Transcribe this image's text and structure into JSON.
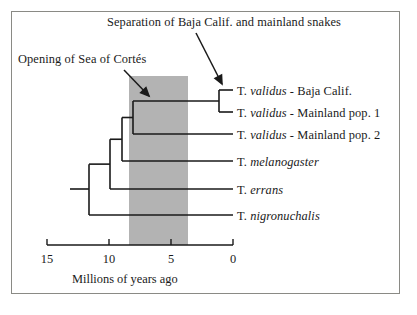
{
  "figure": {
    "width": 417,
    "height": 315,
    "background": "#ffffff",
    "frame_color": "#8a8a85",
    "line_color": "#1a1a1a",
    "band_color": "#b3b3b3"
  },
  "annotations": [
    {
      "id": "separation-event",
      "text": "Separation of Baja Calif. and mainland snakes",
      "x": 107,
      "y": 15,
      "arrow": {
        "x1": 196,
        "y1": 33,
        "x2": 222,
        "y2": 84
      }
    },
    {
      "id": "sea-of-cortes-event",
      "text": "Opening of Sea of Cortés",
      "x": 18,
      "y": 52,
      "arrow": {
        "x1": 124,
        "y1": 70,
        "x2": 149,
        "y2": 96
      }
    }
  ],
  "band": {
    "name": "sea-of-cortes-interval",
    "x": 129,
    "y": 76,
    "width": 59,
    "height": 169,
    "start_mya": 8.3,
    "end_mya": 3.6
  },
  "axis": {
    "label": "Millions of years ago",
    "label_x": 72,
    "label_y": 272,
    "line_y": 245,
    "x_left": 47,
    "x_right": 233,
    "direction": "reversed",
    "ticks": [
      {
        "value": "15",
        "x": 47
      },
      {
        "value": "10",
        "x": 109
      },
      {
        "value": "5",
        "x": 171
      },
      {
        "value": "0",
        "x": 233
      }
    ]
  },
  "chart_data": {
    "type": "tree",
    "title": "",
    "xlabel": "Millions of years ago",
    "ylabel": "",
    "xlim": [
      15,
      0
    ],
    "grid": false,
    "legend": "none",
    "units": "million years ago",
    "taxa": [
      {
        "id": "validus-baja",
        "genus": "T.",
        "species": "validus",
        "suffix": " - Baja Calif.",
        "tip_x": 233,
        "tip_y": 90,
        "label_x": 237,
        "label_y": 84
      },
      {
        "id": "validus-main1",
        "genus": "T.",
        "species": "validus",
        "suffix": " - Mainland pop. 1",
        "tip_x": 233,
        "tip_y": 112,
        "label_x": 237,
        "label_y": 106
      },
      {
        "id": "validus-main2",
        "genus": "T.",
        "species": "validus",
        "suffix": " - Mainland pop. 2",
        "tip_x": 233,
        "tip_y": 134,
        "label_x": 237,
        "label_y": 128
      },
      {
        "id": "melanogaster",
        "genus": "T.",
        "species": "melanogaster",
        "suffix": "",
        "tip_x": 233,
        "tip_y": 161,
        "label_x": 237,
        "label_y": 155
      },
      {
        "id": "errans",
        "genus": "T.",
        "species": "errans",
        "suffix": "",
        "tip_x": 233,
        "tip_y": 189,
        "label_x": 237,
        "label_y": 183
      },
      {
        "id": "nigronuchalis",
        "genus": "T.",
        "species": "nigronuchalis",
        "suffix": "",
        "tip_x": 233,
        "tip_y": 215,
        "label_x": 237,
        "label_y": 209
      }
    ],
    "nodes": [
      {
        "id": "node-validus-baja-main1",
        "x": 219,
        "mya": 1.1,
        "child_y": [
          90,
          112
        ]
      },
      {
        "id": "node-validus-all",
        "x": 133,
        "mya": 8.0,
        "child_y": [
          101,
          134
        ]
      },
      {
        "id": "node-validus-melano",
        "x": 122,
        "mya": 8.9,
        "child_y": [
          117,
          161
        ]
      },
      {
        "id": "node-plus-errans",
        "x": 110,
        "mya": 9.9,
        "child_y": [
          139,
          189
        ]
      },
      {
        "id": "node-root",
        "x": 89,
        "mya": 11.6,
        "child_y": [
          164,
          215
        ]
      }
    ],
    "root_stub": {
      "x_from": 70,
      "x_to": 89,
      "y": 189
    }
  }
}
